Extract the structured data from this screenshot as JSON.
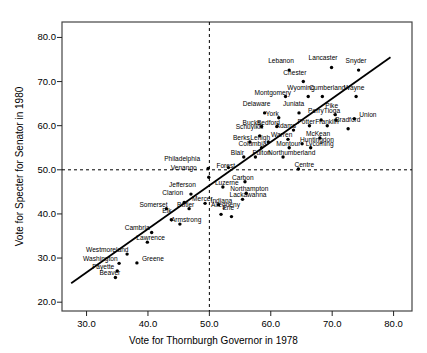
{
  "chart_data": {
    "type": "scatter",
    "title": "",
    "xlabel": "Vote for Thornburgh Governor in 1978",
    "ylabel": "Vote for Specter for Senator in 1980",
    "xlim": [
      26.0,
      83.0
    ],
    "ylim": [
      18.0,
      83.5
    ],
    "xticks": [
      "30.0",
      "40.0",
      "50.0",
      "60.0",
      "70.0",
      "80.0"
    ],
    "xtick_values": [
      30.0,
      40.0,
      50.0,
      60.0,
      70.0,
      80.0
    ],
    "yticks": [
      "20.0",
      "30.0",
      "40.0",
      "50.0",
      "60.0",
      "70.0",
      "80.0"
    ],
    "ytick_values": [
      20.0,
      30.0,
      40.0,
      50.0,
      60.0,
      70.0,
      80.0
    ],
    "grid": false,
    "legend": "none",
    "reference_lines": [
      {
        "name": "vertical-50-line",
        "orientation": "vertical",
        "value": 50.0,
        "style": "dashed"
      },
      {
        "name": "horizontal-50-line",
        "orientation": "horizontal",
        "value": 50.0,
        "style": "dashed"
      }
    ],
    "fit_line": {
      "name": "regression-line",
      "x0": 27.5,
      "y0": 24.3,
      "x1": 79.5,
      "y1": 75.5,
      "style": "solid"
    },
    "points": [
      {
        "label": "Lebanon",
        "x": 63.0,
        "y": 72.6,
        "lx": -21,
        "ly": -8
      },
      {
        "label": "Lancaster",
        "x": 69.9,
        "y": 73.2,
        "lx": -23,
        "ly": -8
      },
      {
        "label": "Snyder",
        "x": 74.3,
        "y": 72.6,
        "lx": -13,
        "ly": -8
      },
      {
        "label": "Chester",
        "x": 65.3,
        "y": 70.0,
        "lx": -20,
        "ly": -8
      },
      {
        "label": "Montgomery",
        "x": 62.4,
        "y": 66.6,
        "lx": -31,
        "ly": -3
      },
      {
        "label": "Wyoming",
        "x": 66.1,
        "y": 66.6,
        "lx": -21,
        "ly": -8
      },
      {
        "label": "Cumberland",
        "x": 68.4,
        "y": 66.6,
        "lx": -13,
        "ly": -8
      },
      {
        "label": "Wayne",
        "x": 73.9,
        "y": 66.6,
        "lx": -12,
        "ly": -8
      },
      {
        "label": "Delaware",
        "x": 59.0,
        "y": 62.9,
        "lx": -22,
        "ly": -8
      },
      {
        "label": "York",
        "x": 61.3,
        "y": 61.8,
        "lx": -13,
        "ly": -3
      },
      {
        "label": "Juniata",
        "x": 64.6,
        "y": 62.9,
        "lx": -16,
        "ly": -8
      },
      {
        "label": "Perry",
        "x": 68.2,
        "y": 61.3,
        "lx": -13,
        "ly": -8
      },
      {
        "label": "Tioga",
        "x": 70.6,
        "y": 61.3,
        "lx": -12,
        "ly": -8
      },
      {
        "label": "Pike",
        "x": 70.5,
        "y": 62.5,
        "lx": -10,
        "ly": -8
      },
      {
        "label": "Union",
        "x": 73.6,
        "y": 61.6,
        "lx": 5,
        "ly": -3
      },
      {
        "label": "Bradford",
        "x": 72.6,
        "y": 59.3,
        "lx": -13,
        "ly": -8
      },
      {
        "label": "Franklin",
        "x": 69.2,
        "y": 60.0,
        "lx": -12,
        "ly": -3
      },
      {
        "label": "Bucks",
        "x": 58.5,
        "y": 59.8,
        "lx": -19,
        "ly": -3
      },
      {
        "label": "Bedford",
        "x": 61.0,
        "y": 59.8,
        "lx": -20,
        "ly": -3
      },
      {
        "label": "Adams",
        "x": 63.7,
        "y": 59.0,
        "lx": -18,
        "ly": -3
      },
      {
        "label": "Potter",
        "x": 66.3,
        "y": 60.0,
        "lx": -12,
        "ly": -3
      },
      {
        "label": "Schuylkill",
        "x": 58.2,
        "y": 57.7,
        "lx": -24,
        "ly": -8
      },
      {
        "label": "McKean",
        "x": 68.0,
        "y": 57.2,
        "lx": -14,
        "ly": -3
      },
      {
        "label": "Berks",
        "x": 56.6,
        "y": 56.3,
        "lx": -17,
        "ly": -3
      },
      {
        "label": "Lehigh",
        "x": 59.6,
        "y": 56.3,
        "lx": -18,
        "ly": -3
      },
      {
        "label": "Warren",
        "x": 62.8,
        "y": 56.9,
        "lx": -17,
        "ly": -3
      },
      {
        "label": "Huntingdon",
        "x": 65.1,
        "y": 55.9,
        "lx": -2,
        "ly": -3
      },
      {
        "label": "Columbia",
        "x": 58.5,
        "y": 55.0,
        "lx": -23,
        "ly": -3
      },
      {
        "label": "Montour",
        "x": 63.0,
        "y": 55.0,
        "lx": -13,
        "ly": -3
      },
      {
        "label": "Lycoming",
        "x": 66.5,
        "y": 55.0,
        "lx": -5,
        "ly": -3
      },
      {
        "label": "Blair",
        "x": 55.6,
        "y": 52.9,
        "lx": -13,
        "ly": -3
      },
      {
        "label": "Fulton",
        "x": 57.5,
        "y": 52.9,
        "lx": -3,
        "ly": -3
      },
      {
        "label": "Northumberland",
        "x": 62.0,
        "y": 52.9,
        "lx": -15,
        "ly": -3
      },
      {
        "label": "Centre",
        "x": 64.5,
        "y": 50.2,
        "lx": -4,
        "ly": -3
      },
      {
        "label": "Forest",
        "x": 53.1,
        "y": 50.5,
        "lx": -12,
        "ly": -1
      },
      {
        "label": "Philadelphia",
        "x": 49.8,
        "y": 50.3,
        "lx": -44,
        "ly": -8
      },
      {
        "label": "Venango",
        "x": 49.9,
        "y": 48.3,
        "lx": -38,
        "ly": -8
      },
      {
        "label": "Carbon",
        "x": 55.8,
        "y": 47.3,
        "lx": -13,
        "ly": -3
      },
      {
        "label": "Luzerne",
        "x": 52.2,
        "y": 46.1,
        "lx": -8,
        "ly": -3
      },
      {
        "label": "Northampton",
        "x": 56.0,
        "y": 44.7,
        "lx": -16,
        "ly": -3
      },
      {
        "label": "Jefferson",
        "x": 47.0,
        "y": 44.5,
        "lx": -22,
        "ly": -8
      },
      {
        "label": "Clarion",
        "x": 45.9,
        "y": 42.6,
        "lx": -22,
        "ly": -8
      },
      {
        "label": "Mercer",
        "x": 49.3,
        "y": 42.4,
        "lx": -13,
        "ly": -3
      },
      {
        "label": "Indiana",
        "x": 51.5,
        "y": 42.1,
        "lx": -8,
        "ly": -3
      },
      {
        "label": "Lackawanna",
        "x": 55.4,
        "y": 43.3,
        "lx": -13,
        "ly": -3
      },
      {
        "label": "Somerset",
        "x": 43.0,
        "y": 41.2,
        "lx": -27,
        "ly": -3
      },
      {
        "label": "Butler",
        "x": 46.7,
        "y": 41.2,
        "lx": -12,
        "ly": -3
      },
      {
        "label": "Erie",
        "x": 53.6,
        "y": 39.4,
        "lx": -9,
        "ly": -8
      },
      {
        "label": "Allegheny",
        "x": 51.9,
        "y": 39.9,
        "lx": -10,
        "ly": -8
      },
      {
        "label": "Elk",
        "x": 43.8,
        "y": 38.7,
        "lx": -9,
        "ly": -8
      },
      {
        "label": "Armstrong",
        "x": 45.2,
        "y": 37.7,
        "lx": -9,
        "ly": -3
      },
      {
        "label": "Cambria",
        "x": 40.6,
        "y": 35.8,
        "lx": -27,
        "ly": -3
      },
      {
        "label": "Lawrence",
        "x": 39.9,
        "y": 33.6,
        "lx": -11,
        "ly": -3
      },
      {
        "label": "Westmoreland",
        "x": 36.6,
        "y": 30.9,
        "lx": -41,
        "ly": -3
      },
      {
        "label": "Washington",
        "x": 35.3,
        "y": 28.8,
        "lx": -36,
        "ly": -3
      },
      {
        "label": "Greene",
        "x": 38.2,
        "y": 28.9,
        "lx": 5,
        "ly": -3
      },
      {
        "label": "Fayette",
        "x": 35.0,
        "y": 27.1,
        "lx": -25,
        "ly": -3
      },
      {
        "label": "Beaver",
        "x": 34.7,
        "y": 25.6,
        "lx": -16,
        "ly": -3
      }
    ]
  }
}
